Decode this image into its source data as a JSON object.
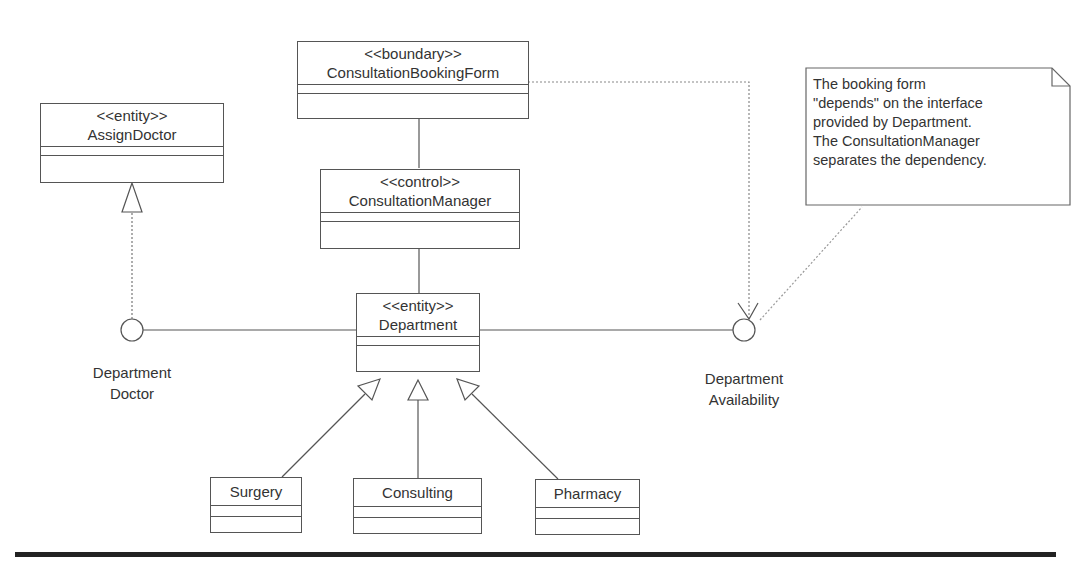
{
  "classes": {
    "booking_form": {
      "stereotype": "<<boundary>>",
      "name": "ConsultationBookingForm"
    },
    "assign_doctor": {
      "stereotype": "<<entity>>",
      "name": "AssignDoctor"
    },
    "manager": {
      "stereotype": "<<control>>",
      "name": "ConsultationManager"
    },
    "department": {
      "stereotype": "<<entity>>",
      "name": "Department"
    },
    "surgery": {
      "name": "Surgery"
    },
    "consulting": {
      "name": "Consulting"
    },
    "pharmacy": {
      "name": "Pharmacy"
    }
  },
  "interfaces": {
    "dept_doctor": {
      "line1": "Department",
      "line2": "Doctor"
    },
    "dept_availability": {
      "line1": "Department",
      "line2": "Availability"
    }
  },
  "note": {
    "lines": [
      "The booking form",
      "\"depends\" on the interface",
      "provided by Department.",
      "The ConsultationManager",
      "separates the dependency."
    ]
  }
}
